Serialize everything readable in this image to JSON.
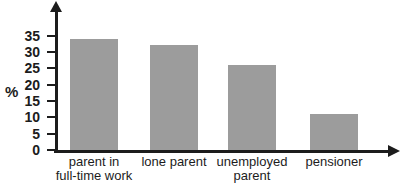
{
  "chart_data": {
    "type": "bar",
    "title": "",
    "categories": [
      "parent in\nfull-time work",
      "lone parent",
      "unemployed\nparent",
      "pensioner"
    ],
    "values": [
      34,
      32,
      26,
      11
    ],
    "xlabel": "",
    "ylabel": "%",
    "ylim": [
      0,
      35
    ],
    "yticks": [
      0,
      5,
      10,
      15,
      20,
      25,
      30,
      35
    ],
    "grid": false,
    "legend": false,
    "bar_color": "#9c9c9c",
    "axis_color": "#1c1c1c",
    "text_color": "#1c1c1c",
    "background_color": "#ffffff"
  }
}
